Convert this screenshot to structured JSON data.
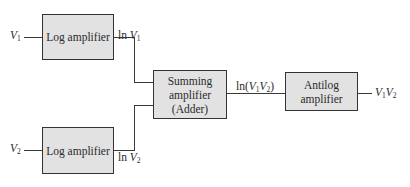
{
  "diagram": {
    "type": "block-diagram",
    "blocks": [
      {
        "id": "log1",
        "label": "Log amplifier"
      },
      {
        "id": "log2",
        "label": "Log amplifier"
      },
      {
        "id": "sum",
        "label_lines": [
          "Summing",
          "amplifier",
          "(Adder)"
        ]
      },
      {
        "id": "antilog",
        "label_lines": [
          "Antilog",
          "amplifier"
        ]
      }
    ],
    "signals": {
      "in1": {
        "var": "V",
        "sub": "1"
      },
      "in2": {
        "var": "V",
        "sub": "2"
      },
      "log1_out": {
        "fn": "ln ",
        "var": "V",
        "sub": "1"
      },
      "log2_out": {
        "fn": "ln ",
        "var": "V",
        "sub": "2"
      },
      "sum_out": {
        "fn": "ln(",
        "v1": "V",
        "s1": "1",
        "v2": "V",
        "s2": "2",
        "close": ")"
      },
      "output": {
        "v1": "V",
        "s1": "1",
        "v2": "V",
        "s2": "2"
      }
    },
    "edges": [
      {
        "from": "in1",
        "to": "log1"
      },
      {
        "from": "in2",
        "to": "log2"
      },
      {
        "from": "log1",
        "to": "sum"
      },
      {
        "from": "log2",
        "to": "sum"
      },
      {
        "from": "sum",
        "to": "antilog"
      },
      {
        "from": "antilog",
        "to": "output"
      }
    ]
  }
}
